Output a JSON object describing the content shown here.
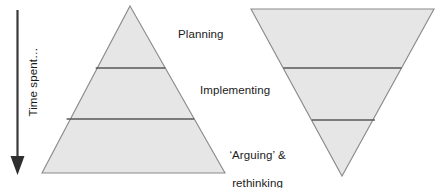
{
  "figure": {
    "background_color": "#ffffff"
  },
  "axis": {
    "label": "Time spent…",
    "direction": "down",
    "arrow_color": "#3a3a3a"
  },
  "labels": {
    "planning": "Planning",
    "implementing": "Implementing",
    "arguing_line1": "‘Arguing’ &",
    "arguing_line2": "rethinking"
  },
  "shapes": {
    "fill_color": "#e6e6e6",
    "stroke_color": "#808080",
    "divider_color": "#595959",
    "left_triangle": {
      "name": "upright-pyramid",
      "apex": [
        130,
        6
      ],
      "base_left": [
        42,
        173
      ],
      "base_right": [
        225,
        173
      ],
      "dividers_y": [
        68,
        119
      ]
    },
    "right_triangle": {
      "name": "inverted-pyramid",
      "top_left": [
        251,
        9
      ],
      "top_right": [
        434,
        9
      ],
      "bottom_vertex": [
        342,
        176
      ],
      "dividers_y": [
        68,
        120
      ]
    }
  }
}
